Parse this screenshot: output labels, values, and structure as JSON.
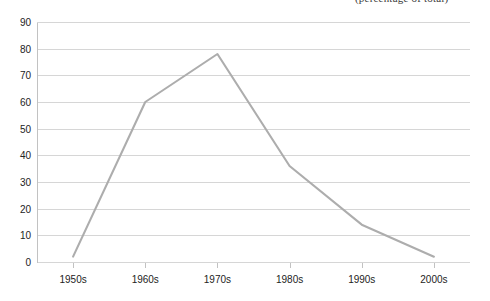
{
  "caption": {
    "top_fragment": "(percentage of total)"
  },
  "chart_data": {
    "type": "line",
    "title": "",
    "subtitle": "",
    "xlabel": "",
    "ylabel": "",
    "categories": [
      "1950s",
      "1960s",
      "1970s",
      "1980s",
      "1990s",
      "2000s"
    ],
    "values": [
      2,
      60,
      78,
      36,
      14,
      2
    ],
    "series": [
      {
        "name": "",
        "values": [
          2,
          60,
          78,
          36,
          14,
          2
        ]
      }
    ],
    "ylim": [
      0,
      90
    ],
    "ytick_labels": [
      "0",
      "10",
      "20",
      "30",
      "40",
      "50",
      "60",
      "70",
      "80",
      "90"
    ],
    "ytick_values": [
      0,
      10,
      20,
      30,
      40,
      50,
      60,
      70,
      80,
      90
    ],
    "xtick_labels": [
      "1950s",
      "1960s",
      "1970s",
      "1980s",
      "1990s",
      "2000s"
    ],
    "grid": true,
    "grid_axis": "y",
    "legend": false,
    "legend_position": "none",
    "line_color": "#adadad",
    "grid_color": "#d6d6d6",
    "axis_color": "#c2c2c2",
    "background_color": "#ffffff",
    "text_color": "#232323"
  }
}
